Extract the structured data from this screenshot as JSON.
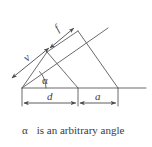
{
  "figure": {
    "name": "angle-geometry-diagram",
    "stroke_color": "#555555",
    "text_color": "#3d3d3d",
    "background": "#ffffff",
    "labels": {
      "v": "v",
      "f": "f",
      "alpha": "α",
      "d": "d",
      "a": "a"
    },
    "dimensions": [
      {
        "key": "v",
        "label": "v",
        "type": "double-arrow",
        "orientation": "slanted"
      },
      {
        "key": "f",
        "label": "f",
        "type": "double-arrow",
        "orientation": "slanted"
      },
      {
        "key": "d",
        "label": "d",
        "type": "double-arrow",
        "orientation": "horizontal"
      },
      {
        "key": "a",
        "label": "a",
        "type": "double-arrow",
        "orientation": "horizontal"
      }
    ],
    "angle": {
      "label": "α",
      "vertex": "left-apex",
      "arc": true
    }
  },
  "caption": {
    "symbol": "α",
    "text": "is an arbitrary angle"
  }
}
